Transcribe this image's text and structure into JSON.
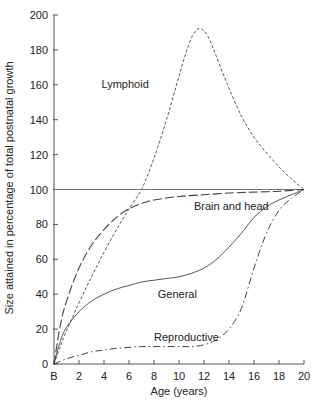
{
  "chart_data": {
    "type": "line",
    "title": "",
    "xlabel": "Age (years)",
    "ylabel": "Size attained in percentage of total postnatal growth",
    "xlim": [
      0,
      20
    ],
    "ylim": [
      0,
      200
    ],
    "x_ticks": [
      {
        "value": 0,
        "label": "B"
      },
      {
        "value": 2,
        "label": "2"
      },
      {
        "value": 4,
        "label": "4"
      },
      {
        "value": 6,
        "label": "6"
      },
      {
        "value": 8,
        "label": "8"
      },
      {
        "value": 10,
        "label": "10"
      },
      {
        "value": 12,
        "label": "12"
      },
      {
        "value": 14,
        "label": "14"
      },
      {
        "value": 16,
        "label": "16"
      },
      {
        "value": 18,
        "label": "18"
      },
      {
        "value": 20,
        "label": "20"
      }
    ],
    "y_ticks": [
      0,
      20,
      40,
      60,
      80,
      100,
      120,
      140,
      160,
      180,
      200
    ],
    "grid": false,
    "legend": "inline labels",
    "reference_line": {
      "y": 100
    },
    "series": [
      {
        "name": "Lymphoid",
        "style": "dashed-fine",
        "label_pos": {
          "x": 3.8,
          "y": 158
        },
        "x": [
          0,
          0.5,
          1,
          2,
          3,
          4,
          5,
          6,
          7,
          8,
          9,
          10,
          10.5,
          11,
          11.5,
          12,
          12.5,
          13,
          14,
          15,
          16,
          17,
          18,
          19,
          20
        ],
        "values": [
          0,
          10,
          19,
          35,
          50,
          64,
          77,
          89,
          100,
          118,
          140,
          165,
          177,
          187,
          192,
          191,
          185,
          176,
          158,
          142,
          130,
          121,
          113,
          106,
          100
        ]
      },
      {
        "name": "Brain and head",
        "style": "long-dash",
        "label_pos": {
          "x": 11.2,
          "y": 88
        },
        "x": [
          0,
          0.5,
          1,
          2,
          3,
          4,
          5,
          6,
          7,
          8,
          10,
          12,
          14,
          16,
          18,
          20
        ],
        "values": [
          0,
          22,
          36,
          55,
          68,
          77,
          84,
          89,
          92,
          94,
          96,
          97,
          98,
          98.5,
          99,
          100
        ]
      },
      {
        "name": "General",
        "style": "solid",
        "label_pos": {
          "x": 8.3,
          "y": 38
        },
        "x": [
          0,
          0.5,
          1,
          2,
          3,
          4,
          5,
          6,
          7,
          8,
          9,
          10,
          11,
          12,
          13,
          14,
          15,
          16,
          17,
          18,
          19,
          20
        ],
        "values": [
          0,
          13,
          21,
          30,
          36,
          40,
          43,
          45,
          47,
          48,
          49,
          50,
          52,
          55,
          60,
          67,
          75,
          84,
          90,
          94,
          97,
          100
        ]
      },
      {
        "name": "Reproductive",
        "style": "dash-dot",
        "label_pos": {
          "x": 8.0,
          "y": 13
        },
        "x": [
          0,
          1,
          2,
          3,
          4,
          5,
          6,
          7,
          8,
          9,
          10,
          11,
          12,
          13,
          14,
          15,
          16,
          17,
          18,
          19,
          20
        ],
        "values": [
          0,
          3,
          5,
          7,
          8,
          9,
          9.5,
          10,
          10,
          10,
          10,
          10,
          11,
          14,
          20,
          32,
          55,
          75,
          88,
          95,
          100
        ]
      }
    ]
  }
}
